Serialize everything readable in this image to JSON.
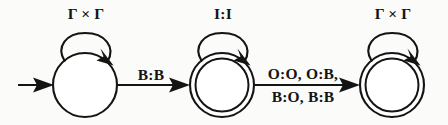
{
  "figure": {
    "background_color": "#fbfbfa",
    "ink_color": "#141414"
  },
  "states": [
    {
      "id": "q0",
      "kind": "start",
      "accepting": false,
      "cx": 85,
      "cy": 85,
      "r": 32,
      "self_loop_label": "Γ × Γ"
    },
    {
      "id": "q1",
      "kind": "accepting",
      "accepting": true,
      "cx": 222,
      "cy": 85,
      "r": 32,
      "self_loop_label": "I:I"
    },
    {
      "id": "q2",
      "kind": "accepting",
      "accepting": true,
      "cx": 392,
      "cy": 85,
      "r": 32,
      "self_loop_label": "Γ × Γ"
    }
  ],
  "start_arrow": {
    "label": "",
    "x1": 18,
    "x2": 53,
    "y": 85
  },
  "transitions": [
    {
      "id": "t0",
      "from": "q0",
      "to": "q1",
      "label_lines": [
        "B:B"
      ],
      "x1": 117,
      "x2": 190,
      "y": 85
    },
    {
      "id": "t1",
      "from": "q1",
      "to": "q2",
      "label_lines": [
        "O:O, O:B,",
        "B:O, B:B"
      ],
      "x1": 254,
      "x2": 360,
      "y": 85
    }
  ],
  "labels": {
    "loop_q0": "Γ × Γ",
    "loop_q1": "I:I",
    "loop_q2": "Γ × Γ",
    "edge_t0_line1": "B:B",
    "edge_t1_line1": "O:O, O:B,",
    "edge_t1_line2": "B:O, B:B"
  }
}
